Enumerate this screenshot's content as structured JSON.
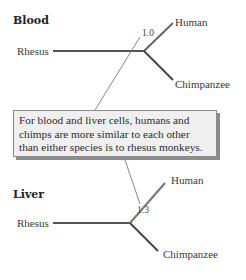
{
  "trees": [
    {
      "title": "Blood",
      "outgroup": "Rhesus",
      "taxa": [
        "Human",
        "Chimpanzee"
      ],
      "distance_label": "1.0"
    },
    {
      "title": "Liver",
      "outgroup": "Rhesus",
      "taxa": [
        "Human",
        "Chimpanzee"
      ],
      "distance_label": "1.3"
    }
  ],
  "note": "For blood and liver cells, humans and chimps are more similar to each other than either species is to rhesus monkeys.",
  "colors": {
    "branch": "#555555",
    "pointer": "#6a6a6a",
    "note_bg": "#efefef",
    "note_shadow": "#8c8c8c"
  }
}
